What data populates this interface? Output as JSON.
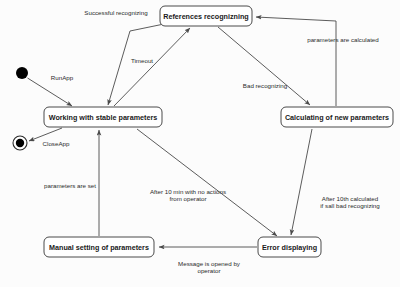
{
  "diagram": {
    "type": "uml-state-machine",
    "colors": {
      "background": "#fcfcfc",
      "stroke": "#4a4a4a",
      "box_fill": "#ffffff",
      "text": "#1a1a1a",
      "node_fill": "#000000"
    },
    "states": [
      {
        "id": "references_recognizing",
        "label": "References recognizning",
        "x": 160,
        "y": 6,
        "w": 92,
        "h": 20
      },
      {
        "id": "working_stable",
        "label": "Working with stable parameters",
        "x": 44,
        "y": 107,
        "w": 118,
        "h": 20
      },
      {
        "id": "calculating_new",
        "label": "Calculating of new parameters",
        "x": 281,
        "y": 107,
        "w": 112,
        "h": 20
      },
      {
        "id": "manual_setting",
        "label": "Manual setting of parameters",
        "x": 44,
        "y": 237,
        "w": 110,
        "h": 20
      },
      {
        "id": "error_displaying",
        "label": "Error displaying",
        "x": 258,
        "y": 237,
        "w": 63,
        "h": 20
      }
    ],
    "pseudostates": [
      {
        "id": "initial",
        "kind": "initial-state-node",
        "cx": 22,
        "cy": 73,
        "r": 6
      },
      {
        "id": "final",
        "kind": "final-state-node",
        "cx": 20,
        "cy": 143,
        "r_outer": 7,
        "r_inner": 4
      }
    ],
    "transitions": [
      {
        "id": "t-run-app",
        "label": "RunApp",
        "from": "initial",
        "to": "working_stable",
        "label_x": 62,
        "label_y": 78
      },
      {
        "id": "t-successful-recognizing",
        "label": "Successful recognizing",
        "from": "references_recognizing",
        "to": "working_stable",
        "label_x": 116,
        "label_y": 13
      },
      {
        "id": "t-timeout",
        "label": "Timeout",
        "from": "working_stable",
        "to": "references_recognizing",
        "label_x": 142,
        "label_y": 61
      },
      {
        "id": "t-bad-recognizing",
        "label": "Bad recognizing",
        "from": "references_recognizing",
        "to": "calculating_new",
        "label_x": 265,
        "label_y": 86
      },
      {
        "id": "t-parameters-are-calculated",
        "label": "parameters are calculated",
        "from": "calculating_new",
        "to": "references_recognizing",
        "label_x": 343,
        "label_y": 40
      },
      {
        "id": "t-close-app",
        "label": "CloseApp",
        "from": "working_stable",
        "to": "final",
        "label_x": 56,
        "label_y": 144
      },
      {
        "id": "t-parameters-are-set",
        "label": "parameters are set",
        "from": "manual_setting",
        "to": "working_stable",
        "label_x": 70,
        "label_y": 186
      },
      {
        "id": "t-after-10-min",
        "label_line1": "After 10 min with no actions",
        "label_line2": "from operator",
        "from": "working_stable",
        "to": "error_displaying",
        "label_x": 188,
        "label_y": 192
      },
      {
        "id": "t-after-10th-calculated",
        "label_line1": "After 10th calculated",
        "label_line2": "if sall bad recognizing",
        "from": "calculating_new",
        "to": "error_displaying",
        "label_x": 350,
        "label_y": 199
      },
      {
        "id": "t-message-opened",
        "label_line1": "Message is opened by",
        "label_line2": "operator",
        "from": "error_displaying",
        "to": "manual_setting",
        "label_x": 209,
        "label_y": 264
      }
    ]
  }
}
